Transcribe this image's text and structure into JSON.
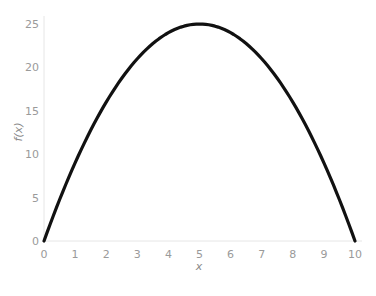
{
  "chart_data": {
    "type": "line",
    "title": "",
    "xlabel": "x",
    "ylabel": "f(x)",
    "xlim": [
      0,
      10
    ],
    "ylim": [
      0,
      25
    ],
    "xticks": [
      0,
      1,
      2,
      3,
      4,
      5,
      6,
      7,
      8,
      9,
      10
    ],
    "yticks": [
      0,
      5,
      10,
      15,
      20,
      25
    ],
    "grid": false,
    "legend": null,
    "series": [
      {
        "name": "f(x) = x(10 - x)",
        "color": "#111111",
        "x": [
          0,
          0.5,
          1,
          1.5,
          2,
          2.5,
          3,
          3.5,
          4,
          4.5,
          5,
          5.5,
          6,
          6.5,
          7,
          7.5,
          8,
          8.5,
          9,
          9.5,
          10
        ],
        "y": [
          0,
          4.75,
          9,
          12.75,
          16,
          18.75,
          21,
          22.75,
          24,
          24.75,
          25,
          24.75,
          24,
          22.75,
          21,
          18.75,
          16,
          12.75,
          9,
          4.75,
          0
        ]
      }
    ]
  },
  "colors": {
    "line": "#111111",
    "axis": "#e6e6e6",
    "tick_text": "#9a9a9a"
  }
}
